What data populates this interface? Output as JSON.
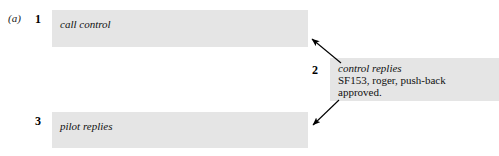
{
  "figure": {
    "label": "(a)",
    "background_color": "#ffffff",
    "box_color": "#e5e5e5",
    "text_color": "#111111"
  },
  "steps": [
    {
      "number": "1",
      "role": "call control",
      "body": "",
      "box": {
        "x": 52,
        "y": 10,
        "width": 256,
        "height": 37
      }
    },
    {
      "number": "2",
      "role": "control replies",
      "body": "SF153, roger, push-back approved.",
      "body_line_1": "SF153, roger, push-back",
      "body_line_2": "approved.",
      "box": {
        "x": 330,
        "y": 58,
        "width": 169,
        "height": 43
      }
    },
    {
      "number": "3",
      "role": "pilot replies",
      "body": "",
      "box": {
        "x": 52,
        "y": 112,
        "width": 256,
        "height": 36
      }
    }
  ],
  "arrows": [
    {
      "name": "arrow-step1-to-step2",
      "from_x": 341,
      "from_y": 63,
      "to_x": 310,
      "to_y": 37
    },
    {
      "name": "arrow-step2-to-step3",
      "from_x": 339,
      "from_y": 100,
      "to_x": 311,
      "to_y": 127
    }
  ]
}
